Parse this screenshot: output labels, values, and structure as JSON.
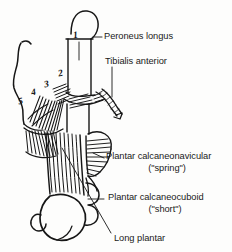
{
  "figure": {
    "background_color": "#fdfdfc",
    "ink_color": "#161616"
  },
  "labels": {
    "peroneus_longus": "Peroneus longus",
    "tibialis_anterior": "Tibialis anterior",
    "plantar_calcaneonavicular": "Plantar calcaneonavicular",
    "plantar_calcaneonavicular_alt": "(\"spring\")",
    "plantar_calcaneocuboid": "Plantar calcaneocuboid",
    "plantar_calcaneocuboid_alt": "(\"short\")",
    "long_plantar": "Long plantar"
  },
  "metatarsal_numbers": {
    "n5": "5",
    "n4": "4",
    "n3": "3",
    "n2": "2",
    "n1": "1"
  }
}
